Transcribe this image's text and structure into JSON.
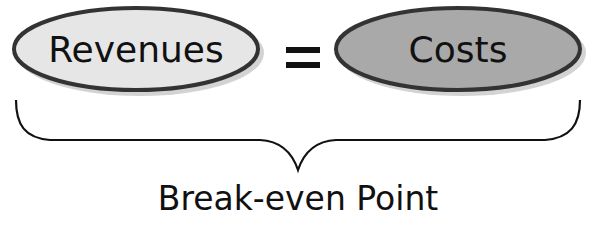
{
  "diagram": {
    "left_term": "Revenues",
    "operator": "=",
    "right_term": "Costs",
    "caption": "Break-even Point"
  },
  "colors": {
    "left_fill": "#e6e6e6",
    "right_fill": "#a9a9a9",
    "stroke": "#333333",
    "shadow": "#c8c8c8"
  }
}
